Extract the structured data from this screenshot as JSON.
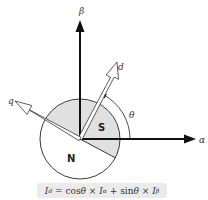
{
  "diagram": {
    "axes": {
      "alpha_label": "α",
      "beta_label": "β",
      "d_label": "d",
      "q_label": "q",
      "theta_label": "θ"
    },
    "rotor": {
      "north_label": "N",
      "south_label": "S",
      "shade_color": "#e0e0e0"
    },
    "formula": "I_d = cosθ × I_α + sinθ × I_β",
    "formula_parts": {
      "lhs": "I",
      "lhs_sub": "d",
      "eq": " = cos",
      "theta1": "θ",
      "times1": " × ",
      "i1": "I",
      "i1_sub": "α",
      "plus": " + sin",
      "theta2": "θ",
      "times2": " × ",
      "i2": "I",
      "i2_sub": "β"
    }
  }
}
